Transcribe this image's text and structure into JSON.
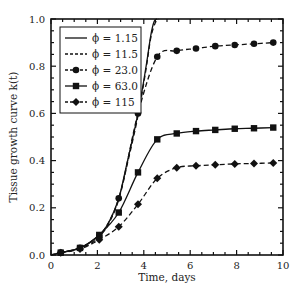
{
  "chart_data": {
    "type": "line",
    "title": "",
    "xlabel": "Time, days",
    "ylabel": "Tissue growth curve k(t)",
    "xlim": [
      0,
      10
    ],
    "ylim": [
      0,
      1.0
    ],
    "xticks": [
      0,
      2,
      4,
      6,
      8,
      10
    ],
    "yticks": [
      0.0,
      0.2,
      0.4,
      0.6,
      0.8,
      1.0
    ],
    "xtick_labels": [
      "0",
      "2",
      "4",
      "6",
      "8",
      "10"
    ],
    "ytick_labels": [
      "0.0",
      "0.2",
      "0.4",
      "0.6",
      "0.8",
      "1.0"
    ],
    "grid": false,
    "legend_position": "upper left",
    "marker_x": [
      0.42,
      1.25,
      2.08,
      2.92,
      3.75,
      4.58,
      5.42,
      6.25,
      7.08,
      7.92,
      8.75,
      9.58
    ],
    "series": [
      {
        "name": "ϕ = 1.15",
        "line": "solid",
        "marker": "none",
        "x": [
          0,
          0.42,
          1.25,
          2.08,
          2.5,
          2.92,
          3.3,
          3.75,
          4.1,
          4.3,
          4.45,
          4.58
        ],
        "values": [
          0.0,
          0.01,
          0.03,
          0.085,
          0.14,
          0.24,
          0.4,
          0.6,
          0.8,
          0.93,
          0.99,
          1.0
        ]
      },
      {
        "name": "ϕ = 11.5",
        "line": "dashed",
        "marker": "none",
        "x": [
          0,
          0.42,
          1.25,
          2.08,
          2.5,
          2.92,
          3.3,
          3.75,
          4.1,
          4.3,
          4.5,
          4.65
        ],
        "values": [
          0.0,
          0.01,
          0.03,
          0.08,
          0.135,
          0.235,
          0.39,
          0.59,
          0.79,
          0.92,
          0.985,
          1.0
        ]
      },
      {
        "name": "ϕ = 23.0",
        "line": "dashed",
        "marker": "circle",
        "x": [
          0.42,
          1.25,
          2.08,
          2.92,
          3.75,
          4.58,
          5.42,
          6.25,
          7.08,
          7.92,
          8.75,
          9.58
        ],
        "values": [
          0.01,
          0.03,
          0.08,
          0.24,
          0.6,
          0.84,
          0.865,
          0.875,
          0.885,
          0.89,
          0.895,
          0.9
        ]
      },
      {
        "name": "ϕ = 63.0",
        "line": "solid",
        "marker": "square",
        "x": [
          0.42,
          1.25,
          2.08,
          2.92,
          3.75,
          4.58,
          5.42,
          6.25,
          7.08,
          7.92,
          8.75,
          9.58
        ],
        "values": [
          0.01,
          0.03,
          0.085,
          0.18,
          0.35,
          0.49,
          0.515,
          0.525,
          0.53,
          0.535,
          0.537,
          0.54
        ]
      },
      {
        "name": "ϕ = 115",
        "line": "dashed",
        "marker": "diamond",
        "x": [
          0.42,
          1.25,
          2.08,
          2.92,
          3.75,
          4.58,
          5.42,
          6.25,
          7.08,
          7.92,
          8.75,
          9.58
        ],
        "values": [
          0.01,
          0.025,
          0.065,
          0.12,
          0.215,
          0.325,
          0.37,
          0.378,
          0.382,
          0.386,
          0.388,
          0.39
        ]
      }
    ]
  }
}
